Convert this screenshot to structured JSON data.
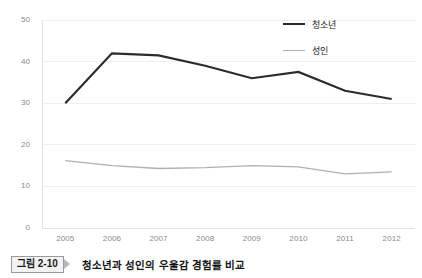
{
  "caption": {
    "tag": "그림 2-10",
    "arrow_icon": "triangle-right-icon",
    "title": "청소년과 성인의 우울감 경험률 비교"
  },
  "legend": {
    "position": "top-right",
    "entries": [
      {
        "label": "청소년",
        "color": "#2b2b2b"
      },
      {
        "label": "성인",
        "color": "#b0b0b0"
      }
    ]
  },
  "chart_data": {
    "type": "line",
    "title": "청소년과 성인의 우울감 경험률 비교",
    "xlabel": "",
    "ylabel": "",
    "categories": [
      "2005",
      "2006",
      "2007",
      "2008",
      "2009",
      "2010",
      "2011",
      "2012"
    ],
    "ylim": [
      0,
      50
    ],
    "yticks": [
      0,
      10,
      20,
      30,
      40,
      50
    ],
    "ytick_labels": [
      "0",
      "10",
      "20",
      "30",
      "40",
      "50"
    ],
    "grid": true,
    "grid_color": "#efefef",
    "series": [
      {
        "name": "청소년",
        "color": "#2b2b2b",
        "width": 2.2,
        "values": [
          30,
          42,
          41.5,
          39,
          36,
          37.5,
          33,
          31
        ]
      },
      {
        "name": "성인",
        "color": "#b0b0b0",
        "width": 1.3,
        "values": [
          16.2,
          15,
          14.3,
          14.5,
          15,
          14.7,
          13,
          13.5
        ]
      }
    ]
  }
}
